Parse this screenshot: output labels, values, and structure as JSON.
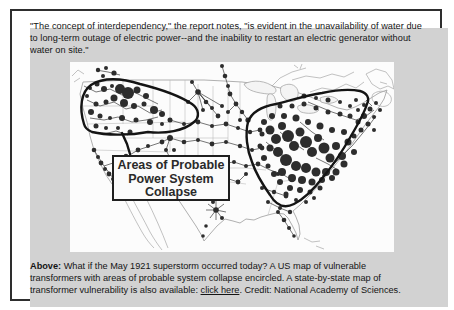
{
  "quote": {
    "lines": [
      "\"The concept of interdependency,\" the report notes, \"is evident in the unavailability of water due",
      "to long-term outage of electric power--and the inability to restart an electric generator without",
      "water on site.\""
    ]
  },
  "map": {
    "label_lines": [
      "Areas of Probable",
      "Power System",
      "Collapse"
    ],
    "dots": [
      [
        20,
        26,
        2
      ],
      [
        27,
        22,
        2.5
      ],
      [
        34,
        27,
        3
      ],
      [
        42,
        24,
        2
      ],
      [
        50,
        27,
        5
      ],
      [
        58,
        31,
        6
      ],
      [
        67,
        28,
        3.5
      ],
      [
        76,
        34,
        3
      ],
      [
        44,
        36,
        3.5
      ],
      [
        36,
        40,
        2.5
      ],
      [
        54,
        41,
        4
      ],
      [
        64,
        44,
        3
      ],
      [
        74,
        42,
        2.5
      ],
      [
        84,
        48,
        4
      ],
      [
        92,
        52,
        3
      ],
      [
        26,
        42,
        2.5
      ],
      [
        21,
        50,
        3
      ],
      [
        30,
        54,
        2.5
      ],
      [
        40,
        56,
        2
      ],
      [
        52,
        56,
        3
      ],
      [
        66,
        58,
        2.5
      ],
      [
        80,
        60,
        3
      ],
      [
        92,
        62,
        2
      ],
      [
        100,
        58,
        2.5
      ],
      [
        26,
        64,
        2.5
      ],
      [
        36,
        66,
        2
      ],
      [
        48,
        66,
        2
      ],
      [
        60,
        70,
        2.5
      ],
      [
        17,
        34,
        2
      ],
      [
        28,
        8,
        2.2
      ],
      [
        36,
        6,
        2
      ],
      [
        44,
        11,
        2.6
      ],
      [
        33,
        14,
        2
      ],
      [
        24,
        88,
        2.3
      ],
      [
        28,
        95,
        2
      ],
      [
        31,
        101,
        2.4
      ],
      [
        35,
        107,
        2
      ],
      [
        39,
        112,
        2.4
      ],
      [
        43,
        117,
        2
      ],
      [
        47,
        123,
        2.2
      ],
      [
        50,
        127,
        2
      ],
      [
        46,
        100,
        2
      ],
      [
        56,
        94,
        2.3
      ],
      [
        68,
        88,
        2.4
      ],
      [
        78,
        84,
        2
      ],
      [
        58,
        104,
        2
      ],
      [
        66,
        110,
        2.3
      ],
      [
        74,
        116,
        2
      ],
      [
        92,
        80,
        2.4
      ],
      [
        100,
        76,
        3
      ],
      [
        96,
        88,
        2
      ],
      [
        100,
        96,
        2.4
      ],
      [
        92,
        104,
        2
      ],
      [
        86,
        110,
        2
      ],
      [
        104,
        88,
        2
      ],
      [
        122,
        20,
        2
      ],
      [
        128,
        30,
        2.8
      ],
      [
        136,
        40,
        2.3
      ],
      [
        142,
        46,
        2
      ],
      [
        148,
        54,
        2.4
      ],
      [
        152,
        44,
        2
      ],
      [
        133,
        48,
        2
      ],
      [
        118,
        40,
        2
      ],
      [
        100,
        58,
        2
      ],
      [
        114,
        62,
        2
      ],
      [
        128,
        60,
        2.4
      ],
      [
        142,
        64,
        2
      ],
      [
        156,
        62,
        2.4
      ],
      [
        168,
        66,
        2
      ],
      [
        114,
        80,
        2.3
      ],
      [
        128,
        78,
        2
      ],
      [
        142,
        82,
        2.4
      ],
      [
        156,
        80,
        2
      ],
      [
        170,
        84,
        2.2
      ],
      [
        108,
        96,
        2
      ],
      [
        122,
        100,
        2.4
      ],
      [
        136,
        98,
        2
      ],
      [
        150,
        102,
        2.3
      ],
      [
        164,
        100,
        2
      ],
      [
        152,
        4,
        2
      ],
      [
        155,
        14,
        2.3
      ],
      [
        158,
        24,
        2
      ],
      [
        160,
        32,
        2.4
      ],
      [
        166,
        42,
        2.4
      ],
      [
        172,
        50,
        2.2
      ],
      [
        178,
        58,
        2.6
      ],
      [
        158,
        50,
        2
      ],
      [
        170,
        58,
        2
      ],
      [
        124,
        106,
        2
      ],
      [
        134,
        112,
        2.4
      ],
      [
        144,
        118,
        2.8
      ],
      [
        140,
        130,
        2.2
      ],
      [
        143,
        140,
        2
      ],
      [
        146,
        148,
        2.8
      ],
      [
        152,
        156,
        2
      ],
      [
        156,
        116,
        2
      ],
      [
        168,
        120,
        2.4
      ],
      [
        176,
        112,
        2
      ],
      [
        133,
        174,
        1.8
      ],
      [
        136,
        164,
        1.8
      ],
      [
        180,
        70,
        2.2
      ],
      [
        190,
        68,
        2.4
      ],
      [
        182,
        88,
        2
      ],
      [
        192,
        86,
        2.4
      ],
      [
        176,
        104,
        2
      ],
      [
        188,
        102,
        2.4
      ],
      [
        192,
        126,
        2
      ],
      [
        204,
        130,
        2.2
      ],
      [
        216,
        134,
        2.4
      ],
      [
        198,
        140,
        2
      ],
      [
        210,
        146,
        2
      ],
      [
        220,
        150,
        2.2
      ],
      [
        222,
        118,
        2.3
      ],
      [
        208,
        112,
        2
      ],
      [
        208,
        150,
        2
      ],
      [
        214,
        158,
        2.3
      ],
      [
        219,
        166,
        2
      ],
      [
        224,
        174,
        1.8
      ],
      [
        194,
        60,
        3
      ],
      [
        200,
        68,
        4.5
      ],
      [
        206,
        77,
        5
      ],
      [
        212,
        64,
        4
      ],
      [
        218,
        74,
        6
      ],
      [
        224,
        84,
        5
      ],
      [
        230,
        70,
        4.5
      ],
      [
        236,
        80,
        6
      ],
      [
        242,
        90,
        5
      ],
      [
        248,
        76,
        4
      ],
      [
        254,
        86,
        5.5
      ],
      [
        260,
        96,
        4.5
      ],
      [
        266,
        84,
        4
      ],
      [
        272,
        94,
        4
      ],
      [
        278,
        80,
        3.5
      ],
      [
        284,
        90,
        3
      ],
      [
        208,
        90,
        5
      ],
      [
        216,
        98,
        6
      ],
      [
        226,
        104,
        5
      ],
      [
        236,
        106,
        5
      ],
      [
        246,
        110,
        4.5
      ],
      [
        256,
        110,
        4
      ],
      [
        266,
        110,
        3.5
      ],
      [
        274,
        102,
        3.5
      ],
      [
        200,
        86,
        3.5
      ],
      [
        194,
        96,
        3
      ],
      [
        190,
        84,
        2.5
      ],
      [
        192,
        72,
        2.5
      ],
      [
        202,
        54,
        3
      ],
      [
        214,
        54,
        3
      ],
      [
        226,
        56,
        3.5
      ],
      [
        238,
        60,
        3
      ],
      [
        250,
        64,
        3.5
      ],
      [
        262,
        68,
        3
      ],
      [
        274,
        70,
        3
      ],
      [
        284,
        74,
        2.5
      ],
      [
        291,
        68,
        2.5
      ],
      [
        288,
        60,
        2.5
      ],
      [
        280,
        54,
        2.5
      ],
      [
        270,
        52,
        2.5
      ],
      [
        258,
        50,
        2.5
      ],
      [
        246,
        46,
        2.5
      ],
      [
        234,
        42,
        2.5
      ],
      [
        222,
        44,
        2.5
      ],
      [
        210,
        44,
        2.5
      ],
      [
        294,
        54,
        3
      ],
      [
        300,
        47,
        2.5
      ],
      [
        306,
        41,
        2
      ],
      [
        294,
        43,
        2
      ],
      [
        286,
        38,
        2
      ],
      [
        304,
        55,
        2
      ],
      [
        310,
        48,
        2
      ],
      [
        298,
        62,
        2.5
      ],
      [
        304,
        68,
        2
      ],
      [
        212,
        110,
        4
      ],
      [
        222,
        116,
        4
      ],
      [
        232,
        118,
        4
      ],
      [
        242,
        120,
        3.5
      ],
      [
        252,
        118,
        3
      ],
      [
        262,
        116,
        3
      ],
      [
        220,
        126,
        3
      ],
      [
        230,
        128,
        3
      ],
      [
        240,
        130,
        2.5
      ],
      [
        250,
        126,
        2.5
      ],
      [
        210,
        120,
        3
      ],
      [
        204,
        112,
        3
      ],
      [
        198,
        104,
        2.5
      ],
      [
        216,
        132,
        2.5
      ],
      [
        226,
        138,
        2
      ],
      [
        236,
        140,
        2
      ],
      [
        244,
        136,
        2
      ],
      [
        234,
        34,
        2.5
      ],
      [
        246,
        36,
        2
      ],
      [
        258,
        38,
        2.5
      ],
      [
        270,
        40,
        2
      ],
      [
        280,
        44,
        2
      ],
      [
        288,
        48,
        2
      ]
    ]
  },
  "caption": {
    "bold_label": "Above:",
    "line1_rest": " What if the May 1921 superstorm occurred today? A US map of vulnerable",
    "line2": "transformers with areas of probable system collapse encircled. A state-by-state map of",
    "line3_pre": "transformer vulnerability is also available: ",
    "link_label": "click here",
    "line3_post": ". Credit: National Academy of Sciences."
  },
  "colors": {
    "panel_bg": "#d2d2d2",
    "frame_border": "#2e2e2e",
    "map_bg": "#fcfcfc",
    "dot": "#2d2d2d",
    "enclosure": "#141414",
    "text": "#141414"
  }
}
